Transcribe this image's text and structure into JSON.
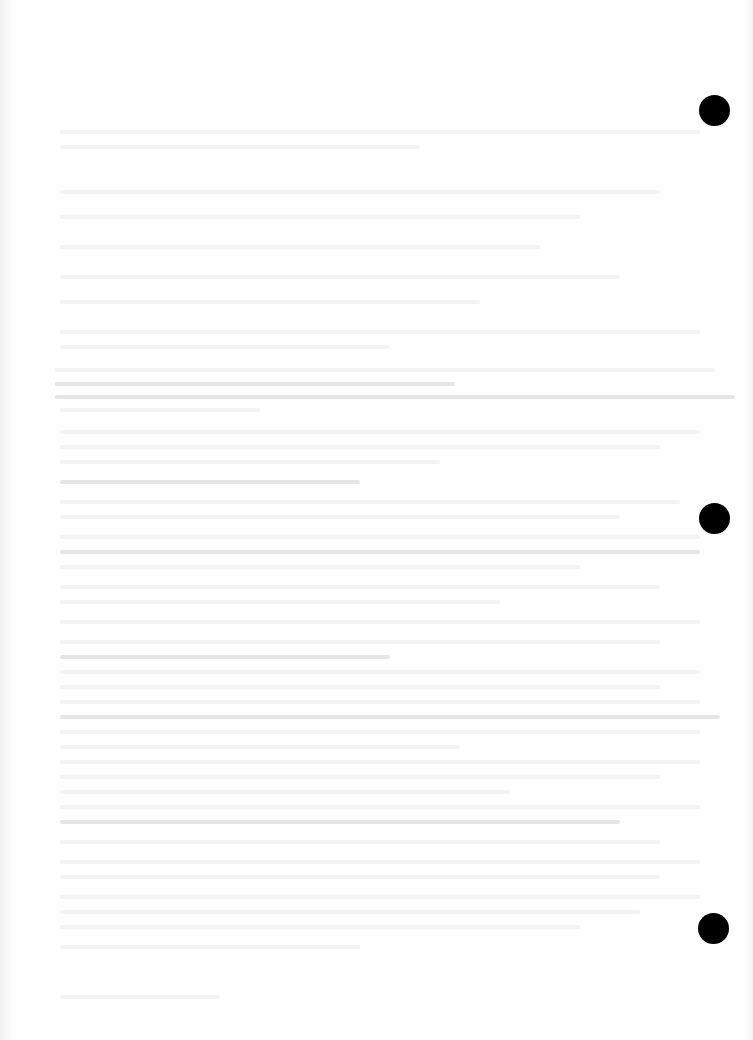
{
  "document": {
    "type": "scanned page",
    "legible_text": [],
    "hole_punches": [
      {
        "cx": 714,
        "cy": 110
      },
      {
        "cx": 714,
        "cy": 518
      },
      {
        "cx": 713,
        "cy": 928
      }
    ],
    "colors": {
      "paper": "#fefefe",
      "ghost_text": "#e0e0e0",
      "hole": "#000000"
    }
  }
}
